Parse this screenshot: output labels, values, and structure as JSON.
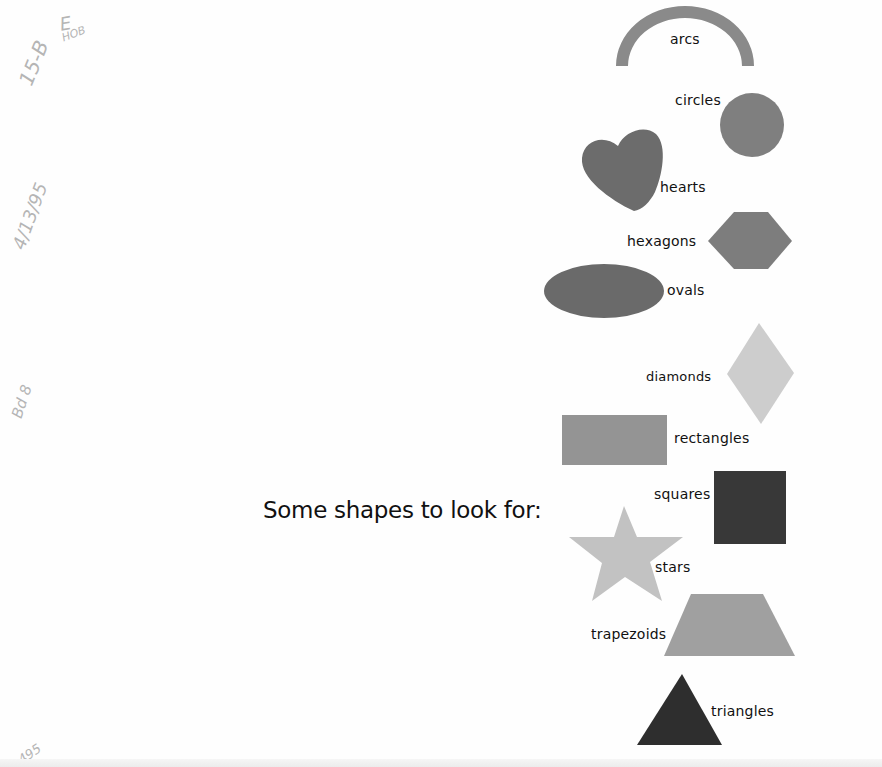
{
  "heading": "Some shapes to look for:",
  "handwritten_notes": [
    {
      "id": "code",
      "text": "15-B"
    },
    {
      "id": "grade",
      "text": "E"
    },
    {
      "id": "hob",
      "text": "HOB"
    },
    {
      "id": "date",
      "text": "4/13/95"
    },
    {
      "id": "bd",
      "text": "Bd 8"
    },
    {
      "id": "num",
      "text": "495"
    }
  ],
  "shapes": [
    {
      "name": "arc",
      "label": "arcs",
      "color": "#8a8a8a"
    },
    {
      "name": "circle",
      "label": "circles",
      "color": "#7f7f7f"
    },
    {
      "name": "heart",
      "label": "hearts",
      "color": "#6c6c6c"
    },
    {
      "name": "hexagon",
      "label": "hexagons",
      "color": "#7d7d7d"
    },
    {
      "name": "oval",
      "label": "ovals",
      "color": "#6a6a6a"
    },
    {
      "name": "diamond",
      "label": "diamonds",
      "color": "#cdcdcd"
    },
    {
      "name": "rectangle",
      "label": "rectangles",
      "color": "#949494"
    },
    {
      "name": "square",
      "label": "squares",
      "color": "#383838"
    },
    {
      "name": "star",
      "label": "stars",
      "color": "#c2c2c2"
    },
    {
      "name": "trapezoid",
      "label": "trapezoids",
      "color": "#a0a0a0"
    },
    {
      "name": "triangle",
      "label": "triangles",
      "color": "#2e2e2e"
    }
  ]
}
